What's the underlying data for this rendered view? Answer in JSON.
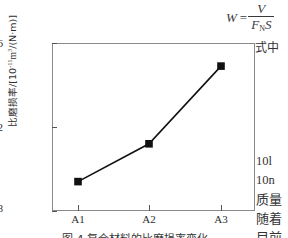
{
  "chart_data": {
    "type": "line",
    "title": "",
    "xlabel": "",
    "ylabel": "比磨损率/[10⁻¹¹m³/(N·m)]",
    "ylabel_prefix": "比磨损率/[10",
    "ylabel_exponent": "-11",
    "ylabel_suffix": "m",
    "ylabel_exponent2": "3",
    "ylabel_tail": "/(N·m)]",
    "categories": [
      "A1",
      "A2",
      "A3"
    ],
    "values": [
      9.4,
      11.2,
      14.9
    ],
    "ylim": [
      8,
      16
    ],
    "yticks": [
      "8",
      "12",
      "16"
    ],
    "ytick_values": [
      8,
      12,
      16
    ],
    "grid": false,
    "legend": "none",
    "marker": "square",
    "marker_color": "#111111",
    "line_color": "#111111"
  },
  "formula": {
    "lhs": "W",
    "equals": "=",
    "numerator": "V",
    "denominator_f": "F",
    "denominator_sub": "N",
    "denominator_s": "S"
  },
  "text": {
    "shizhong": "式中",
    "lines": [
      "10l",
      "10n",
      "质量",
      "随着",
      "目前"
    ]
  },
  "caption": "图 4   复合材料的比磨损率变化"
}
